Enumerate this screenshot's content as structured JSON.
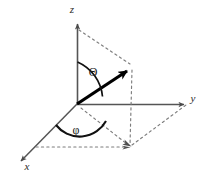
{
  "figure": {
    "background_color": "#ffffff",
    "axis_color": "#555555",
    "vector_color": "#000000",
    "dash_color": "#7a7a7a",
    "arc_color": "#111111",
    "width": 207,
    "height": 173
  },
  "axes": [
    {
      "name": "z-axis",
      "label": "z",
      "direction": "up",
      "label_x": 77,
      "label_y": 11
    },
    {
      "name": "y-axis",
      "label": "y",
      "direction": "right",
      "label_x": 193,
      "label_y": 100
    },
    {
      "name": "x-axis",
      "label": "x",
      "direction": "down-left",
      "label_x": 26,
      "label_y": 168
    }
  ],
  "angles": [
    {
      "name": "polar-angle",
      "label": "Θ",
      "label_x": 92,
      "label_y": 72,
      "between": "z-axis and vector"
    },
    {
      "name": "azimuthal-angle",
      "label": "φ",
      "label_x": 75,
      "label_y": 130,
      "between": "x-axis and projection"
    }
  ],
  "vector": {
    "name": "radial-vector",
    "origin_x": 77,
    "origin_y": 104,
    "tip_x": 133,
    "tip_y": 66
  },
  "projection": {
    "name": "xy-plane-projection-point",
    "x": 130,
    "y": 147
  },
  "dashed_guides": [
    {
      "name": "z-to-tip-guide",
      "from_x": 78,
      "from_y": 30,
      "to_x": 131,
      "to_y": 65
    },
    {
      "name": "tip-to-projection-drop",
      "from_x": 132,
      "from_y": 68,
      "to_x": 130,
      "to_y": 146
    },
    {
      "name": "projection-to-x-guide",
      "from_x": 36,
      "from_y": 147,
      "to_x": 128,
      "to_y": 147
    },
    {
      "name": "projection-to-y-guide",
      "from_x": 131,
      "from_y": 145,
      "to_x": 187,
      "to_y": 104
    },
    {
      "name": "origin-to-projection-guide",
      "from_x": 80,
      "from_y": 108,
      "to_x": 128,
      "to_y": 145
    }
  ]
}
